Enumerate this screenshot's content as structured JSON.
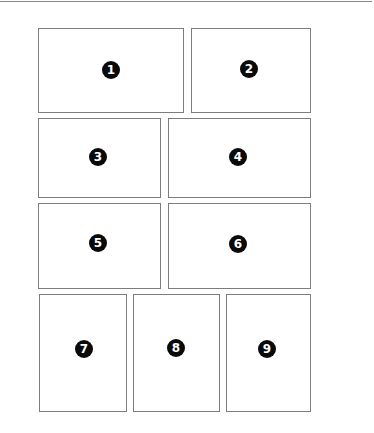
{
  "diagram": {
    "type": "page-layout-grid",
    "rows": 4,
    "panels": [
      {
        "label": "1",
        "x": 38,
        "y": 28,
        "w": 146,
        "h": 85,
        "cx": 111,
        "cy": 70
      },
      {
        "label": "2",
        "x": 191,
        "y": 28,
        "w": 120,
        "h": 85,
        "cx": 249,
        "cy": 69
      },
      {
        "label": "3",
        "x": 38,
        "y": 118,
        "w": 123,
        "h": 80,
        "cx": 98,
        "cy": 157
      },
      {
        "label": "4",
        "x": 168,
        "y": 118,
        "w": 143,
        "h": 80,
        "cx": 238,
        "cy": 157
      },
      {
        "label": "5",
        "x": 38,
        "y": 203,
        "w": 123,
        "h": 86,
        "cx": 98,
        "cy": 243
      },
      {
        "label": "6",
        "x": 168,
        "y": 203,
        "w": 143,
        "h": 86,
        "cx": 238,
        "cy": 244
      },
      {
        "label": "7",
        "x": 39,
        "y": 294,
        "w": 88,
        "h": 118,
        "cx": 84,
        "cy": 349
      },
      {
        "label": "8",
        "x": 133,
        "y": 294,
        "w": 87,
        "h": 118,
        "cx": 176,
        "cy": 348
      },
      {
        "label": "9",
        "x": 226,
        "y": 294,
        "w": 85,
        "h": 118,
        "cx": 267,
        "cy": 349
      }
    ]
  },
  "colors": {
    "panel_border": "#7d7d7d",
    "badge_fill": "#0a0a0a",
    "badge_text": "#ffffff",
    "rule": "#8a8a8a"
  }
}
